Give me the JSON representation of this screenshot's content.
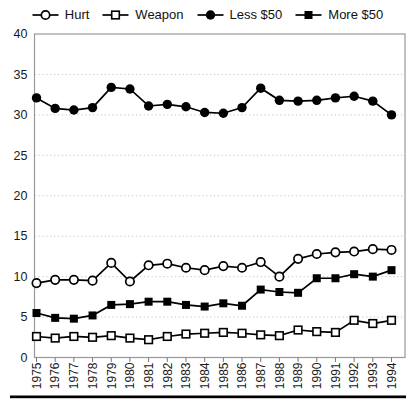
{
  "chart_data": {
    "type": "line",
    "title": "",
    "xlabel": "",
    "ylabel": "",
    "categories": [
      "1975",
      "1976",
      "1977",
      "1978",
      "1979",
      "1980",
      "1981",
      "1982",
      "1983",
      "1984",
      "1985",
      "1986",
      "1987",
      "1988",
      "1989",
      "1990",
      "1991",
      "1992",
      "1993",
      "1994"
    ],
    "x_tick_rotation": -90,
    "ylim": [
      0,
      40
    ],
    "yticks": [
      0,
      5,
      10,
      15,
      20,
      25,
      30,
      35,
      40
    ],
    "grid": {
      "horizontal_dotted": true,
      "at": [
        5,
        10,
        15,
        20,
        25,
        30,
        35
      ]
    },
    "legend_position": "top",
    "series": [
      {
        "name": "Hurt",
        "marker": "circle-open",
        "values": [
          9.2,
          9.6,
          9.6,
          9.5,
          11.7,
          9.4,
          11.4,
          11.6,
          11.1,
          10.8,
          11.3,
          11.1,
          11.8,
          10.0,
          12.2,
          12.8,
          13.0,
          13.1,
          13.4,
          13.3
        ]
      },
      {
        "name": "Weapon",
        "marker": "square-open",
        "values": [
          2.6,
          2.4,
          2.6,
          2.5,
          2.7,
          2.4,
          2.2,
          2.6,
          2.9,
          3.0,
          3.1,
          3.0,
          2.8,
          2.7,
          3.4,
          3.2,
          3.1,
          4.6,
          4.2,
          4.6
        ]
      },
      {
        "name": "Less $50",
        "marker": "circle-filled",
        "values": [
          32.1,
          30.8,
          30.6,
          30.9,
          33.4,
          33.2,
          31.1,
          31.3,
          31.0,
          30.3,
          30.2,
          30.9,
          33.3,
          31.8,
          31.7,
          31.8,
          32.1,
          32.3,
          31.7,
          30.0
        ]
      },
      {
        "name": "More $50",
        "marker": "square-filled",
        "values": [
          5.5,
          4.9,
          4.8,
          5.2,
          6.5,
          6.6,
          6.9,
          6.9,
          6.5,
          6.3,
          6.7,
          6.4,
          8.4,
          8.1,
          8.0,
          9.8,
          9.8,
          10.3,
          10.0,
          10.8
        ]
      }
    ]
  },
  "colors": {
    "series": "#000000",
    "frame": "#999999",
    "grid": "#c8c8c8",
    "tick": "#777777",
    "text": "#1a1a1a",
    "background": "#ffffff",
    "bottom_rule": "#000000"
  }
}
